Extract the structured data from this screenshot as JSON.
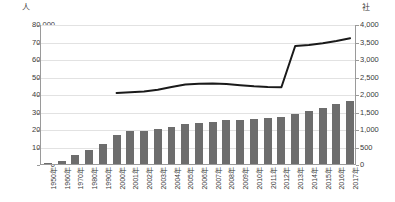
{
  "chart_data": {
    "type": "bar",
    "title": "",
    "subtitle": "",
    "xlabel": "",
    "ylabel": "人",
    "y2label": "社",
    "grid": true,
    "legend": "none",
    "categories": [
      "1950年",
      "1960年",
      "1970年",
      "1980年",
      "1990年",
      "2000年",
      "2001年",
      "2002年",
      "2003年",
      "2004年",
      "2005年",
      "2006年",
      "2007年",
      "2008年",
      "2009年",
      "2010年",
      "2011年",
      "2012年",
      "2013年",
      "2014年",
      "2015年",
      "2016年",
      "2017年"
    ],
    "ylim": [
      0,
      80000
    ],
    "yticks": [
      "0",
      "10,000",
      "20,000",
      "30,000",
      "40,000",
      "50,000",
      "60,000",
      "70,000",
      "80,000"
    ],
    "ytick_values": [
      0,
      10000,
      20000,
      30000,
      40000,
      50000,
      60000,
      70000,
      80000
    ],
    "y2lim": [
      0,
      4000
    ],
    "y2ticks": [
      "0",
      "500",
      "1,000",
      "1,500",
      "2,000",
      "2,500",
      "3,000",
      "3,500",
      "4,000"
    ],
    "y2tick_values": [
      0,
      500,
      1000,
      1500,
      2000,
      2500,
      3000,
      3500,
      4000
    ],
    "series": [
      {
        "name": "人",
        "type": "bar",
        "axis": "left",
        "color": "#6d6d6d",
        "values": [
          300,
          2000,
          5000,
          8200,
          11300,
          16300,
          18600,
          19100,
          20200,
          21400,
          22600,
          23400,
          24200,
          25000,
          25200,
          25600,
          26500,
          27100,
          28800,
          30500,
          32200,
          34200,
          36000
        ]
      },
      {
        "name": "社",
        "type": "line",
        "axis": "right",
        "color": "#1a1a1a",
        "values": [
          null,
          null,
          null,
          null,
          null,
          2060,
          2080,
          2100,
          2150,
          2230,
          2300,
          2320,
          2330,
          2310,
          2280,
          2250,
          2230,
          2220,
          3400,
          3430,
          3480,
          3540,
          3620
        ]
      }
    ]
  }
}
